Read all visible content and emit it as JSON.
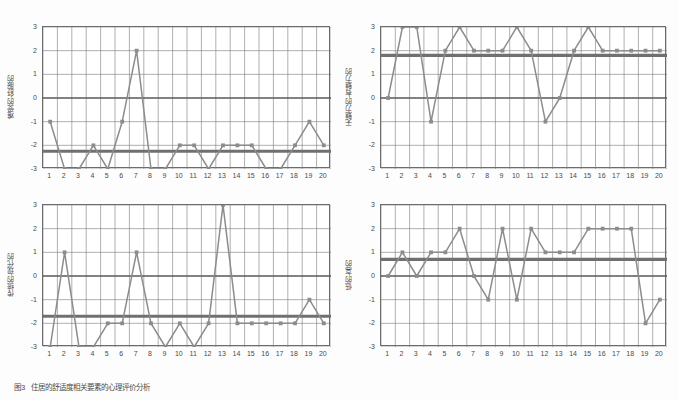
{
  "figure": {
    "caption_number": "图3",
    "caption_text": "住居的舒适度相关要素的心理评价分析",
    "top_title": ""
  },
  "axis": {
    "y_ticks": [
      "3",
      "2",
      "1",
      "0",
      "-1",
      "-2",
      "-3"
    ],
    "x_ticks": [
      "1",
      "2",
      "3",
      "4",
      "5",
      "6",
      "7",
      "8",
      "9",
      "10",
      "11",
      "12",
      "13",
      "14",
      "15",
      "16",
      "17",
      "18",
      "19",
      "20"
    ]
  },
  "colors": {
    "series_line": "#8c8c8c",
    "mean_line": "#707070",
    "zero_line": "#595959",
    "grid": "#7a7a7a",
    "frame": "#6c6c6c",
    "text": "#4b4b4b"
  },
  "chart_data": [
    {
      "type": "line",
      "title": "",
      "ylabel": "难受的-舒服的",
      "xlabel": "",
      "categories": [
        "1",
        "2",
        "3",
        "4",
        "5",
        "6",
        "7",
        "8",
        "9",
        "10",
        "11",
        "12",
        "13",
        "14",
        "15",
        "16",
        "17",
        "18",
        "19",
        "20"
      ],
      "values": [
        -1,
        -3,
        -3,
        -2,
        -3,
        -1,
        2,
        -3,
        -3,
        -2,
        -2,
        -3,
        -2,
        -2,
        -2,
        -3,
        -3,
        -2,
        -1,
        -2
      ],
      "mean": -2.25,
      "ylim": [
        -3,
        3
      ],
      "grid": true,
      "legend": "none"
    },
    {
      "type": "line",
      "title": "",
      "ylabel": "无魅力的-有魅力的",
      "xlabel": "",
      "categories": [
        "1",
        "2",
        "3",
        "4",
        "5",
        "6",
        "7",
        "8",
        "9",
        "10",
        "11",
        "12",
        "13",
        "14",
        "15",
        "16",
        "17",
        "18",
        "19",
        "20"
      ],
      "values": [
        0,
        3,
        3,
        -1,
        2,
        3,
        2,
        2,
        2,
        3,
        2,
        -1,
        0,
        2,
        3,
        2,
        2,
        2,
        2,
        2
      ],
      "mean": 1.8,
      "ylim": [
        -3,
        3
      ],
      "grid": true,
      "legend": "none"
    },
    {
      "type": "line",
      "title": "",
      "ylabel": "传统的-现代的",
      "xlabel": "",
      "categories": [
        "1",
        "2",
        "3",
        "4",
        "5",
        "6",
        "7",
        "8",
        "9",
        "10",
        "11",
        "12",
        "13",
        "14",
        "15",
        "16",
        "17",
        "18",
        "19",
        "20"
      ],
      "values": [
        -3,
        1,
        -3,
        -3,
        -2,
        -2,
        1,
        -2,
        -3,
        -2,
        -3,
        -2,
        3,
        -2,
        -2,
        -2,
        -2,
        -2,
        -1,
        -2
      ],
      "mean": -1.7,
      "ylim": [
        -3,
        3
      ],
      "grid": true,
      "legend": "none"
    },
    {
      "type": "line",
      "title": "",
      "ylabel": "低的-高的",
      "xlabel": "",
      "categories": [
        "1",
        "2",
        "3",
        "4",
        "5",
        "6",
        "7",
        "8",
        "9",
        "10",
        "11",
        "12",
        "13",
        "14",
        "15",
        "16",
        "17",
        "18",
        "19",
        "20"
      ],
      "values": [
        0,
        1,
        0,
        1,
        1,
        2,
        0,
        -1,
        2,
        -1,
        2,
        1,
        1,
        1,
        2,
        2,
        2,
        2,
        -2,
        -1
      ],
      "mean": 0.7,
      "ylim": [
        -3,
        3
      ],
      "grid": true,
      "legend": "none"
    }
  ]
}
